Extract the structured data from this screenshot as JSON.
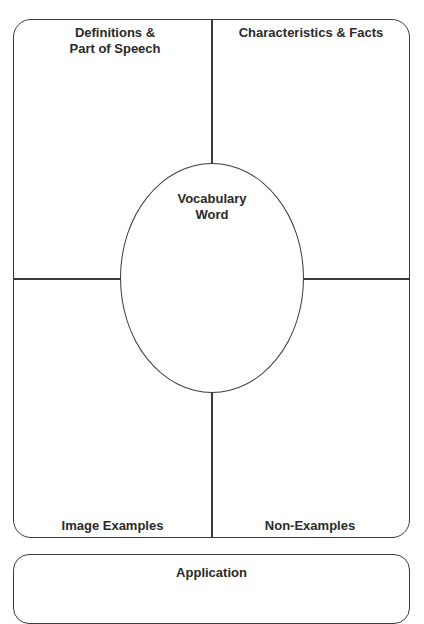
{
  "organizer": {
    "quadrants": {
      "top_left": "Definitions & Part of Speech",
      "top_left_line1": "Definitions &",
      "top_left_line2": "Part of Speech",
      "top_right": "Characteristics & Facts",
      "bottom_left": "Image Examples",
      "bottom_right": "Non-Examples"
    },
    "center": {
      "line1": "Vocabulary",
      "line2": "Word"
    },
    "application": {
      "label": "Application"
    }
  }
}
